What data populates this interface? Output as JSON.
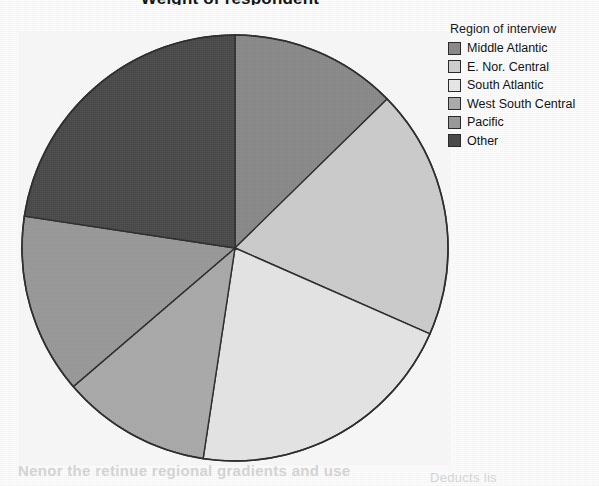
{
  "chart_data": {
    "type": "pie",
    "title": "Weight of respondent",
    "title_clipped": true,
    "legend_title": "Region of interview",
    "legend_position": "right",
    "categories": [
      "Middle Atlantic",
      "E. Nor. Central",
      "South Atlantic",
      "West South Central",
      "Pacific",
      "Other"
    ],
    "values": [
      12.7,
      18.9,
      20.8,
      11.3,
      13.7,
      22.6
    ],
    "units": "percent",
    "start_angle_deg": 0,
    "direction": "clockwise",
    "slices": [
      {
        "label": "Middle Atlantic",
        "value": 12.7,
        "start_deg": 0.0,
        "end_deg": 45.6,
        "color": "#8c8c8c"
      },
      {
        "label": "E. Nor. Central",
        "value": 18.9,
        "start_deg": 45.6,
        "end_deg": 113.8,
        "color": "#d0d0d0"
      },
      {
        "label": "South Atlantic",
        "value": 20.8,
        "start_deg": 113.8,
        "end_deg": 188.6,
        "color": "#e9e9e9"
      },
      {
        "label": "West South Central",
        "value": 11.3,
        "start_deg": 188.6,
        "end_deg": 229.4,
        "color": "#adadad"
      },
      {
        "label": "Pacific",
        "value": 13.7,
        "start_deg": 229.4,
        "end_deg": 278.6,
        "color": "#9c9c9c"
      },
      {
        "label": "Other",
        "value": 22.6,
        "start_deg": 278.6,
        "end_deg": 360.0,
        "color": "#4c4c4c"
      }
    ],
    "colors": {
      "middle_atlantic": "#8c8c8c",
      "e_nor_central": "#d0d0d0",
      "south_atlantic": "#e9e9e9",
      "west_south_central": "#adadad",
      "pacific": "#9c9c9c",
      "other": "#4c4c4c",
      "outline": "#2e2e2e",
      "background": "#ffffff"
    },
    "geometry": {
      "cx": 216,
      "cy": 216,
      "r": 213
    }
  },
  "legend": {
    "title": "Region of interview",
    "items": [
      {
        "label": "Middle Atlantic",
        "color": "#8c8c8c"
      },
      {
        "label": "E. Nor. Central",
        "color": "#d0d0d0"
      },
      {
        "label": "South Atlantic",
        "color": "#e9e9e9"
      },
      {
        "label": "West South Central",
        "color": "#adadad"
      },
      {
        "label": "Pacific",
        "color": "#9c9c9c"
      },
      {
        "label": "Other",
        "color": "#4c4c4c"
      }
    ]
  },
  "artifacts": {
    "bleed_bottom_text": "Nenor the retinue regional gradients and use",
    "bleed_right_text": "Deducts  lis"
  }
}
